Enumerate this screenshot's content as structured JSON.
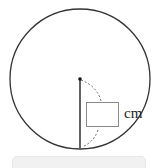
{
  "diagram": {
    "title": "",
    "shape": "circle",
    "circle": {
      "cx": 80,
      "cy": 79,
      "r": 70,
      "stroke": "#333333"
    },
    "center_point": {
      "x": 80,
      "y": 79
    },
    "radius_segment": {
      "from": [
        80,
        79
      ],
      "to": [
        80,
        148
      ],
      "label": "radius"
    },
    "answer_box": {
      "value": ""
    },
    "unit_label": "cm"
  },
  "input_bar": {
    "value": ""
  }
}
